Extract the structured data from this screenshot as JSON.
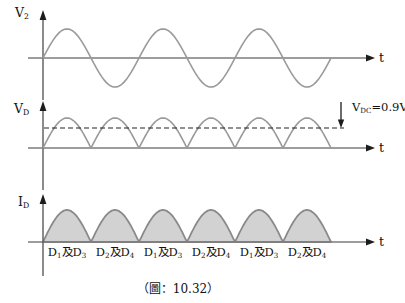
{
  "figure": {
    "caption": "（圖：10.32）",
    "colors": {
      "waveform": "#9a9a9a",
      "axis": "#7d7d7d",
      "vertical_axis": "#5a5a5a",
      "arrowhead": "#1c1c1c",
      "hump_fill": "#d2d2d2",
      "hump_stroke": "#8a8a8a",
      "dashed_line": "#222222",
      "text": "#111111",
      "background": "#ffffff"
    },
    "plots": {
      "v2": {
        "label_base": "V",
        "label_sub": "2",
        "t_label": "t"
      },
      "vd": {
        "label_base": "V",
        "label_sub": "D",
        "t_label": "t",
        "annotation": {
          "p1": "V",
          "s1": "DC",
          "p2": "=0.9V",
          "s2": "2"
        }
      },
      "id": {
        "label_base": "I",
        "label_sub": "D",
        "t_label": "t",
        "hump_labels": [
          {
            "p1": "D",
            "s1": "1",
            "p2": "及D",
            "s2": "3"
          },
          {
            "p1": "D",
            "s1": "2",
            "p2": "及D",
            "s2": "4"
          },
          {
            "p1": "D",
            "s1": "1",
            "p2": "及D",
            "s2": "3"
          },
          {
            "p1": "D",
            "s1": "2",
            "p2": "及D",
            "s2": "4"
          },
          {
            "p1": "D",
            "s1": "1",
            "p2": "及D",
            "s2": "3"
          },
          {
            "p1": "D",
            "s1": "2",
            "p2": "及D",
            "s2": "4"
          }
        ]
      }
    }
  },
  "chart_data": [
    {
      "type": "line",
      "title": "V2 input waveform",
      "ylabel": "V2",
      "xlabel": "t",
      "description": "Pure sinusoid starting at the origin rising, 3 full cycles, no numeric scale shown",
      "series": [
        {
          "name": "V2",
          "waveform": "sin",
          "cycles": 3
        }
      ],
      "grid": false,
      "legend": false
    },
    {
      "type": "line",
      "title": "VD full-wave rectified output",
      "ylabel": "VD",
      "xlabel": "t",
      "description": "Full-wave rectified sinusoid |sin|, 6 half-cycle humps touching zero",
      "annotations": [
        {
          "text": "VDC=0.9V2",
          "meaning": "dashed horizontal DC average level at about 0.64 of peak, marked by a downward arrow"
        }
      ],
      "series": [
        {
          "name": "VD",
          "waveform": "abs(sin)",
          "humps": 6
        }
      ],
      "grid": false,
      "legend": false
    },
    {
      "type": "area",
      "title": "ID diode current",
      "ylabel": "ID",
      "xlabel": "t",
      "description": "Full-wave rectified current, 6 gray-shaded half-sine humps; conducting diode pair labeled under each hump",
      "segment_labels": [
        "D1及D3",
        "D2及D4",
        "D1及D3",
        "D2及D4",
        "D1及D3",
        "D2及D4"
      ],
      "series": [
        {
          "name": "ID",
          "waveform": "abs(sin)",
          "humps": 6
        }
      ],
      "grid": false,
      "legend": false
    }
  ]
}
